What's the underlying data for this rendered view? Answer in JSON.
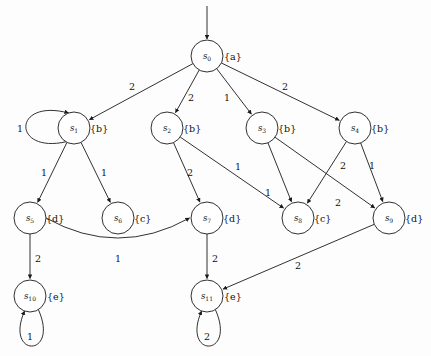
{
  "diagram": {
    "kind": "labeled directed graph",
    "colors": {
      "background": "#fdfdfd",
      "stroke": "#1a1a1a",
      "node_fill": "#ffffff",
      "text": "#111111"
    },
    "initial_state": "s0",
    "nodes": [
      {
        "id": "s0",
        "base": "s",
        "sub": "0",
        "ap": "{a}",
        "cx": 207,
        "cy": 56,
        "r": 16,
        "ap_dx": 17,
        "ap_dy": 0
      },
      {
        "id": "s1",
        "base": "s",
        "sub": "1",
        "ap": "{b}",
        "cx": 74,
        "cy": 128,
        "r": 16,
        "ap_dx": 16,
        "ap_dy": 0
      },
      {
        "id": "s2",
        "base": "s",
        "sub": "2",
        "ap": "{b}",
        "cx": 167,
        "cy": 128,
        "r": 16,
        "ap_dx": 16,
        "ap_dy": 0
      },
      {
        "id": "s3",
        "base": "s",
        "sub": "3",
        "ap": "{b}",
        "cx": 262,
        "cy": 128,
        "r": 16,
        "ap_dx": 16,
        "ap_dy": 0
      },
      {
        "id": "s4",
        "base": "s",
        "sub": "4",
        "ap": "{b}",
        "cx": 355,
        "cy": 128,
        "r": 16,
        "ap_dx": 16,
        "ap_dy": 0
      },
      {
        "id": "s5",
        "base": "s",
        "sub": "5",
        "ap": "{d}",
        "cx": 30,
        "cy": 218,
        "r": 16,
        "ap_dx": 16,
        "ap_dy": 0
      },
      {
        "id": "s6",
        "base": "s",
        "sub": "6",
        "ap": "{c}",
        "cx": 118,
        "cy": 218,
        "r": 16,
        "ap_dx": 16,
        "ap_dy": 0
      },
      {
        "id": "s7",
        "base": "s",
        "sub": "7",
        "ap": "{d}",
        "cx": 207,
        "cy": 218,
        "r": 16,
        "ap_dx": 16,
        "ap_dy": 0
      },
      {
        "id": "s8",
        "base": "s",
        "sub": "8",
        "ap": "{c}",
        "cx": 298,
        "cy": 218,
        "r": 16,
        "ap_dx": 16,
        "ap_dy": 0
      },
      {
        "id": "s9",
        "base": "s",
        "sub": "9",
        "ap": "{d}",
        "cx": 389,
        "cy": 218,
        "r": 16,
        "ap_dx": 16,
        "ap_dy": 0
      },
      {
        "id": "s10",
        "base": "s",
        "sub": "10",
        "ap": "{e}",
        "cx": 30,
        "cy": 296,
        "r": 16,
        "ap_dx": 17,
        "ap_dy": 0
      },
      {
        "id": "s11",
        "base": "s",
        "sub": "11",
        "ap": "{e}",
        "cx": 207,
        "cy": 296,
        "r": 16,
        "ap_dx": 17,
        "ap_dy": 0
      }
    ],
    "edges": [
      {
        "from": "s0",
        "to": "s1",
        "label": "2",
        "lx": 132,
        "ly": 86
      },
      {
        "from": "s0",
        "to": "s2",
        "label": "2",
        "lx": 191,
        "ly": 97
      },
      {
        "from": "s0",
        "to": "s3",
        "label": "1",
        "lx": 227,
        "ly": 97
      },
      {
        "from": "s0",
        "to": "s4",
        "label": "2",
        "lx": 285,
        "ly": 86
      },
      {
        "from": "s1",
        "to": "s1",
        "label": "1",
        "lx": 20,
        "ly": 128,
        "self": true,
        "dir": "left"
      },
      {
        "from": "s1",
        "to": "s5",
        "label": "1",
        "lx": 44,
        "ly": 172
      },
      {
        "from": "s1",
        "to": "s6",
        "label": "1",
        "lx": 104,
        "ly": 172
      },
      {
        "from": "s2",
        "to": "s7",
        "label": "2",
        "lx": 190,
        "ly": 172
      },
      {
        "from": "s2",
        "to": "s8",
        "label": "1",
        "lx": 238,
        "ly": 166
      },
      {
        "from": "s3",
        "to": "s8",
        "label": "1",
        "lx": 268,
        "ly": 192
      },
      {
        "from": "s3",
        "to": "s9",
        "label": "2",
        "lx": 338,
        "ly": 202
      },
      {
        "from": "s4",
        "to": "s8",
        "label": "2",
        "lx": 343,
        "ly": 165
      },
      {
        "from": "s4",
        "to": "s9",
        "label": "1",
        "lx": 372,
        "ly": 165
      },
      {
        "from": "s5",
        "to": "s7",
        "label": "1",
        "lx": 118,
        "ly": 258,
        "curved": true
      },
      {
        "from": "s5",
        "to": "s10",
        "label": "2",
        "lx": 38,
        "ly": 258
      },
      {
        "from": "s7",
        "to": "s11",
        "label": "2",
        "lx": 215,
        "ly": 258
      },
      {
        "from": "s9",
        "to": "s11",
        "label": "2",
        "lx": 298,
        "ly": 265
      },
      {
        "from": "s10",
        "to": "s10",
        "label": "1",
        "lx": 30,
        "ly": 336,
        "self": true,
        "dir": "down"
      },
      {
        "from": "s11",
        "to": "s11",
        "label": "2",
        "lx": 207,
        "ly": 336,
        "self": true,
        "dir": "down"
      }
    ]
  }
}
